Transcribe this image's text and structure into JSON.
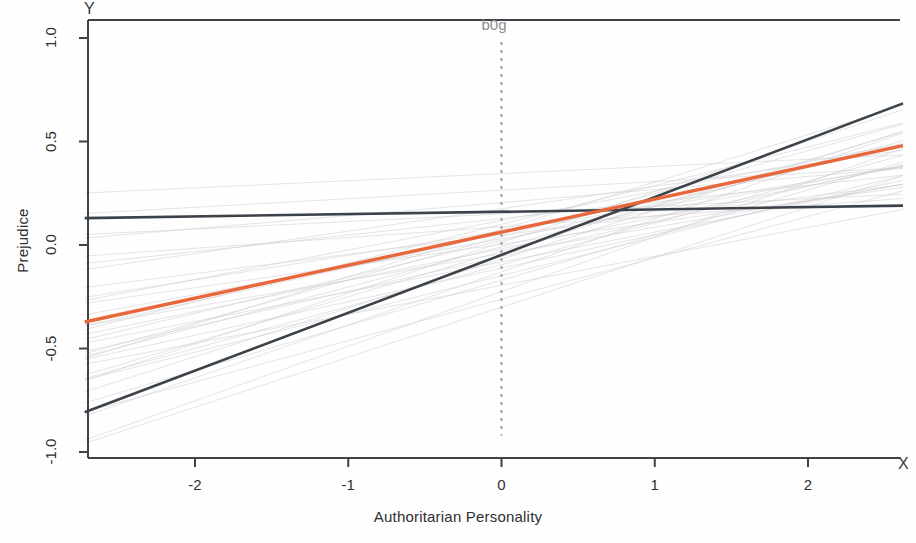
{
  "figure": {
    "y_letter": "Y",
    "x_letter": "X",
    "annotation": {
      "text": "b0g",
      "x_value": 0,
      "color": "#8d8d8d"
    }
  },
  "chart_data": {
    "type": "line",
    "title": "",
    "xlabel": "Authoritarian Personality",
    "ylabel": "Prejudice",
    "xlim": [
      -2.72,
      2.62
    ],
    "ylim": [
      -1.1,
      1.1
    ],
    "xticks": [
      -2,
      -1,
      0,
      1,
      2
    ],
    "xticklabels": [
      "-2",
      "-1",
      "0",
      "1",
      "2"
    ],
    "yticks": [
      1.0,
      0.5,
      0.0,
      -0.5,
      -1.0
    ],
    "yticklabels": [
      "1.0",
      "0.5",
      "0.0",
      "-0.5",
      "-1.0"
    ],
    "grid": false,
    "legend": false,
    "annotations": [
      {
        "label": "b0g",
        "type": "vertical-dotted-line",
        "x": 0,
        "y_top": 0.98,
        "y_bottom": -0.92,
        "color": "#9a9a9a"
      }
    ],
    "series": [
      {
        "name": "average-regression-line",
        "color": "#e8673c",
        "width": 3.4,
        "style": "solid",
        "intercept": 0.062,
        "slope": 0.1595,
        "x": [
          -2.72,
          2.62
        ],
        "values": [
          -0.372,
          0.48
        ]
      },
      {
        "name": "steep-group-line",
        "color": "#3c4249",
        "width": 2.6,
        "style": "solid",
        "intercept": -0.048,
        "slope": 0.2795,
        "x": [
          -2.72,
          2.62
        ],
        "values": [
          -0.808,
          0.684
        ]
      },
      {
        "name": "flat-group-line",
        "color": "#3c4249",
        "width": 2.6,
        "style": "solid",
        "intercept": 0.1605,
        "slope": 0.0113,
        "x": [
          -2.72,
          2.62
        ],
        "values": [
          0.13,
          0.19
        ]
      }
    ],
    "faint_lines": {
      "name": "individual-group-lines",
      "color": "#c9c9cf",
      "width": 0.9,
      "count": 34,
      "description": "Faint light-gray regression lines for individual groups fanning out around the average line",
      "lines": [
        {
          "intercept": 0.345,
          "slope": 0.0345
        },
        {
          "intercept": 0.265,
          "slope": 0.0415
        },
        {
          "intercept": 0.205,
          "slope": 0.063
        },
        {
          "intercept": 0.175,
          "slope": 0.108
        },
        {
          "intercept": 0.15,
          "slope": 0.0365
        },
        {
          "intercept": 0.128,
          "slope": 0.08
        },
        {
          "intercept": 0.118,
          "slope": 0.142
        },
        {
          "intercept": 0.1,
          "slope": 0.187
        },
        {
          "intercept": 0.088,
          "slope": 0.052
        },
        {
          "intercept": 0.075,
          "slope": 0.229
        },
        {
          "intercept": 0.068,
          "slope": 0.118
        },
        {
          "intercept": 0.055,
          "slope": 0.164
        },
        {
          "intercept": 0.048,
          "slope": 0.093
        },
        {
          "intercept": 0.04,
          "slope": 0.208
        },
        {
          "intercept": 0.03,
          "slope": 0.135
        },
        {
          "intercept": 0.022,
          "slope": 0.176
        },
        {
          "intercept": 0.012,
          "slope": 0.245
        },
        {
          "intercept": 0.004,
          "slope": 0.105
        },
        {
          "intercept": -0.008,
          "slope": 0.195
        },
        {
          "intercept": -0.018,
          "slope": 0.152
        },
        {
          "intercept": -0.03,
          "slope": 0.22
        },
        {
          "intercept": -0.042,
          "slope": 0.128
        },
        {
          "intercept": -0.055,
          "slope": 0.169
        },
        {
          "intercept": -0.068,
          "slope": 0.236
        },
        {
          "intercept": -0.082,
          "slope": 0.144
        },
        {
          "intercept": -0.095,
          "slope": 0.202
        },
        {
          "intercept": -0.112,
          "slope": 0.162
        },
        {
          "intercept": -0.13,
          "slope": 0.256
        },
        {
          "intercept": -0.148,
          "slope": 0.185
        },
        {
          "intercept": -0.17,
          "slope": 0.218
        },
        {
          "intercept": -0.195,
          "slope": 0.14
        },
        {
          "intercept": -0.225,
          "slope": 0.264
        },
        {
          "intercept": -0.262,
          "slope": 0.2
        },
        {
          "intercept": -0.3,
          "slope": 0.242
        }
      ]
    }
  }
}
